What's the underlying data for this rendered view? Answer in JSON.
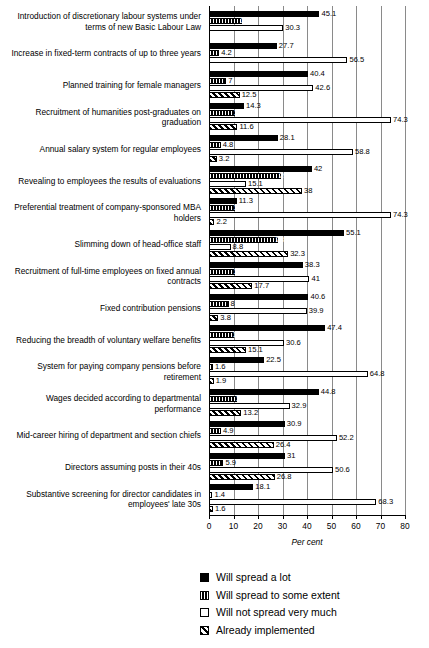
{
  "chart_data": {
    "type": "bar",
    "orientation": "horizontal",
    "title": "",
    "xlabel": "Per cent",
    "ylabel": "",
    "xlim": [
      0,
      80
    ],
    "xticks": [
      0,
      10,
      20,
      30,
      40,
      50,
      60,
      70,
      80
    ],
    "xticklabels": [
      "0",
      "10",
      "20",
      "30",
      "40",
      "50",
      "60",
      "70",
      "80"
    ],
    "grid": true,
    "legend_position": "bottom",
    "series_names": [
      "Will spread a lot",
      "Will spread to some extent",
      "Will not spread very much",
      "Already implemented"
    ],
    "categories": [
      "Introduction of discretionary labour systems under terms of new Basic Labour Law",
      "Increase in fixed-term contracts of up to three years",
      "Planned training for female managers",
      "Recruitment of humanities post-graduates on graduation",
      "Annual salary system for regular employees",
      "Revealing to employees the results of evaluations",
      "Preferential treatment of company-sponsored MBA holders",
      "Slimming down of head-office staff",
      "Recruitment of full-time employees on fixed annual contracts",
      "Fixed contribution pensions",
      "Reducing the breadth of voluntary welfare benefits",
      "System for paying company pensions before retirement",
      "Wages decided according to departmental performance",
      "Mid-career hiring of department and section chiefs",
      "Directors assuming posts in their 40s",
      "Substantive screening for director candidates in employees' late 30s"
    ],
    "series": [
      {
        "name": "Will spread a lot",
        "values": [
          45.1,
          27.7,
          40.4,
          14.3,
          28.1,
          42,
          11.3,
          55.1,
          38.3,
          40.6,
          47.4,
          22.5,
          44.8,
          30.9,
          31,
          18.1
        ]
      },
      {
        "name": "Will spread to some extent",
        "values": [
          13.5,
          4.2,
          7,
          10.8,
          4.8,
          29.3,
          10.7,
          28,
          10.7,
          8,
          10.4,
          1.6,
          11.6,
          4.9,
          5.9,
          1.4
        ]
      },
      {
        "name": "Will not spread very much",
        "values": [
          30.3,
          56.5,
          42.6,
          74.3,
          58.8,
          15.1,
          74.3,
          8.8,
          41,
          39.9,
          30.6,
          64.8,
          32.9,
          52.2,
          50.6,
          68.3
        ]
      },
      {
        "name": "Already implemented",
        "values": [
          null,
          null,
          12.5,
          11.6,
          3.2,
          38,
          2.2,
          32.3,
          17.7,
          3.8,
          15.1,
          1.9,
          13.2,
          26.4,
          26.8,
          1.6
        ]
      }
    ],
    "value_labels": [
      [
        "45.1",
        "13.5",
        "30.3",
        null
      ],
      [
        "27.7",
        "4.2",
        "56.5",
        null
      ],
      [
        "40.4",
        "7",
        "42.6",
        "12.5"
      ],
      [
        "14.3",
        "10.8",
        "74.3",
        "11.6"
      ],
      [
        "28.1",
        "4.8",
        "58.8",
        "3.2"
      ],
      [
        "42",
        "29.3",
        "15.1",
        "38"
      ],
      [
        "11.3",
        "10.7",
        "74.3",
        "2.2"
      ],
      [
        "55.1",
        "28",
        "8.8",
        "32.3"
      ],
      [
        "38.3",
        "10.7",
        "41",
        "17.7"
      ],
      [
        "40.6",
        "8",
        "39.9",
        "3.8"
      ],
      [
        "47.4",
        "10.4",
        "30.6",
        "15.1"
      ],
      [
        "22.5",
        "1.6",
        "64.8",
        "1.9"
      ],
      [
        "44.8",
        "11.6",
        "32.9",
        "13.2"
      ],
      [
        "30.9",
        "4.9",
        "52.2",
        "26.4"
      ],
      [
        "31",
        "5.9",
        "50.6",
        "26.8"
      ],
      [
        "18.1",
        "1.4",
        "68.3",
        "1.6"
      ]
    ]
  },
  "legend": {
    "items": [
      {
        "label": "Will spread a lot",
        "style": "solid-black"
      },
      {
        "label": "Will spread to some extent",
        "style": "vertical-stripes"
      },
      {
        "label": "Will not spread very much",
        "style": "white-outline"
      },
      {
        "label": "Already implemented",
        "style": "diagonal-hatch"
      }
    ]
  },
  "axis": {
    "title": "Per cent",
    "ticklabels": [
      "0",
      "10",
      "20",
      "30",
      "40",
      "50",
      "60",
      "70",
      "80"
    ]
  }
}
